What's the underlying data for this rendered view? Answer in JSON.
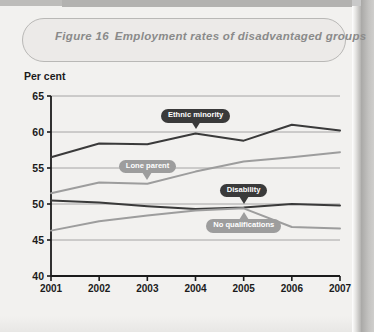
{
  "figure": {
    "number": "Figure 16",
    "title": "Employment rates of disadvantaged groups"
  },
  "colors": {
    "dark_line": "#3a3a3a",
    "light_line": "#9d9d9d",
    "gridline": "#9c9c9c",
    "axis": "#1b1b1b",
    "card_bg": "#eceae8",
    "page_bg": "#f2f1ef",
    "title_text": "#8a8a8a"
  },
  "chart_data": {
    "type": "line",
    "title": "Employment rates of disadvantaged groups",
    "xlabel": "",
    "ylabel": "Per cent",
    "ylim": [
      40,
      65
    ],
    "yticks": [
      40,
      45,
      50,
      55,
      60,
      65
    ],
    "grid": true,
    "legend": "inline-callouts",
    "categories": [
      "2001",
      "2002",
      "2003",
      "2004",
      "2005",
      "2006",
      "2007"
    ],
    "series": [
      {
        "name": "Ethnic minority",
        "color": "#3a3a3a",
        "values": [
          56.5,
          58.4,
          58.3,
          59.8,
          58.8,
          61.0,
          60.2
        ]
      },
      {
        "name": "Lone parent",
        "color": "#9d9d9d",
        "values": [
          51.5,
          53.0,
          52.8,
          54.5,
          55.9,
          56.5,
          57.2
        ]
      },
      {
        "name": "Disability",
        "color": "#3a3a3a",
        "values": [
          50.5,
          50.2,
          49.7,
          49.3,
          49.5,
          50.0,
          49.8
        ]
      },
      {
        "name": "No qualifications",
        "color": "#9d9d9d",
        "values": [
          46.3,
          47.6,
          48.4,
          49.1,
          49.4,
          46.8,
          46.6
        ]
      }
    ],
    "annotations": [
      {
        "text": "Ethnic minority",
        "style": "dark",
        "pointer": "down",
        "x": "2004",
        "y": 59.8
      },
      {
        "text": "Lone parent",
        "style": "light",
        "pointer": "down",
        "x": "2003",
        "y": 52.8
      },
      {
        "text": "Disability",
        "style": "dark",
        "pointer": "down",
        "x": "2005",
        "y": 49.5
      },
      {
        "text": "No qualifications",
        "style": "light",
        "pointer": "up",
        "x": "2005",
        "y": 49.4
      }
    ]
  }
}
